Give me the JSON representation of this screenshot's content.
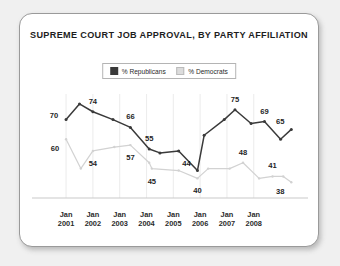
{
  "card": {
    "title": "SUPREME COURT JOB APPROVAL, BY PARTY AFFILIATION"
  },
  "legend": {
    "position": "top-center",
    "entries": [
      {
        "label": "% Republicans",
        "color": "#3a3a3a",
        "swatch": "republicans-swatch"
      },
      {
        "label": "% Democrats",
        "color": "#dcdcdc",
        "swatch": "democrats-swatch"
      }
    ]
  },
  "chart_data": {
    "type": "line",
    "title": "SUPREME COURT JOB APPROVAL, BY PARTY AFFILIATION",
    "xlabel": "",
    "ylabel": "",
    "ylim": [
      30,
      80
    ],
    "grid": "vertical-only",
    "legend_position": "top-center",
    "tick_labels": [
      {
        "line1": "Jan",
        "line2": "2001"
      },
      {
        "line1": "Jan",
        "line2": "2002"
      },
      {
        "line1": "Jan",
        "line2": "2003"
      },
      {
        "line1": "Jan",
        "line2": "2004"
      },
      {
        "line1": "Jan",
        "line2": "2005"
      },
      {
        "line1": "Jan",
        "line2": "2006"
      },
      {
        "line1": "Jan",
        "line2": "2007"
      },
      {
        "line1": "Jan",
        "line2": "2008"
      }
    ],
    "series": [
      {
        "name": "% Republicans",
        "color": "#3a3a3a",
        "points": [
          {
            "x": 0.0,
            "y": 70,
            "label": "70"
          },
          {
            "x": 0.5,
            "y": 78,
            "label": ""
          },
          {
            "x": 1.0,
            "y": 74,
            "label": "74"
          },
          {
            "x": 1.75,
            "y": 70,
            "label": ""
          },
          {
            "x": 2.4,
            "y": 66,
            "label": "66"
          },
          {
            "x": 3.1,
            "y": 55,
            "label": "55"
          },
          {
            "x": 3.5,
            "y": 53,
            "label": ""
          },
          {
            "x": 4.2,
            "y": 54,
            "label": ""
          },
          {
            "x": 4.9,
            "y": 44,
            "label": "44"
          },
          {
            "x": 5.15,
            "y": 62,
            "label": ""
          },
          {
            "x": 5.9,
            "y": 70,
            "label": ""
          },
          {
            "x": 6.3,
            "y": 75,
            "label": "75"
          },
          {
            "x": 6.9,
            "y": 68,
            "label": ""
          },
          {
            "x": 7.4,
            "y": 69,
            "label": "69"
          },
          {
            "x": 8.0,
            "y": 60,
            "label": ""
          },
          {
            "x": 8.4,
            "y": 65,
            "label": "65"
          }
        ]
      },
      {
        "name": "% Democrats",
        "color": "#d2d2d2",
        "points": [
          {
            "x": 0.0,
            "y": 60,
            "label": "60"
          },
          {
            "x": 0.55,
            "y": 45,
            "label": ""
          },
          {
            "x": 1.0,
            "y": 54,
            "label": "54"
          },
          {
            "x": 1.8,
            "y": 56,
            "label": ""
          },
          {
            "x": 2.4,
            "y": 57,
            "label": "57"
          },
          {
            "x": 3.1,
            "y": 48,
            "label": ""
          },
          {
            "x": 3.2,
            "y": 45,
            "label": "45"
          },
          {
            "x": 4.2,
            "y": 44,
            "label": ""
          },
          {
            "x": 4.9,
            "y": 40,
            "label": "40"
          },
          {
            "x": 5.3,
            "y": 45,
            "label": ""
          },
          {
            "x": 6.1,
            "y": 45,
            "label": ""
          },
          {
            "x": 6.6,
            "y": 48,
            "label": "48"
          },
          {
            "x": 7.2,
            "y": 40,
            "label": ""
          },
          {
            "x": 7.7,
            "y": 41,
            "label": "41"
          },
          {
            "x": 8.1,
            "y": 41,
            "label": ""
          },
          {
            "x": 8.4,
            "y": 38,
            "label": "38"
          }
        ]
      }
    ],
    "data_labels": [
      {
        "text": "70",
        "series": "% Republicans",
        "x": 0.0,
        "y": 70,
        "anchor": "left-above"
      },
      {
        "text": "74",
        "series": "% Republicans",
        "x": 1.0,
        "y": 74,
        "anchor": "above"
      },
      {
        "text": "66",
        "series": "% Republicans",
        "x": 2.4,
        "y": 66,
        "anchor": "above"
      },
      {
        "text": "55",
        "series": "% Republicans",
        "x": 3.1,
        "y": 55,
        "anchor": "above"
      },
      {
        "text": "44",
        "series": "% Republicans",
        "x": 4.9,
        "y": 44,
        "anchor": "above-left"
      },
      {
        "text": "75",
        "series": "% Republicans",
        "x": 6.3,
        "y": 75,
        "anchor": "above"
      },
      {
        "text": "69",
        "series": "% Republicans",
        "x": 7.4,
        "y": 69,
        "anchor": "above"
      },
      {
        "text": "65",
        "series": "% Republicans",
        "x": 8.4,
        "y": 65,
        "anchor": "above-left"
      },
      {
        "text": "60",
        "series": "% Democrats",
        "x": 0.0,
        "y": 60,
        "anchor": "below-left"
      },
      {
        "text": "54",
        "series": "% Democrats",
        "x": 1.0,
        "y": 54,
        "anchor": "below"
      },
      {
        "text": "57",
        "series": "% Democrats",
        "x": 2.4,
        "y": 57,
        "anchor": "below"
      },
      {
        "text": "45",
        "series": "% Democrats",
        "x": 3.2,
        "y": 45,
        "anchor": "below"
      },
      {
        "text": "40",
        "series": "% Democrats",
        "x": 4.9,
        "y": 40,
        "anchor": "below"
      },
      {
        "text": "48",
        "series": "% Democrats",
        "x": 6.6,
        "y": 48,
        "anchor": "above"
      },
      {
        "text": "41",
        "series": "% Democrats",
        "x": 7.7,
        "y": 41,
        "anchor": "above"
      },
      {
        "text": "38",
        "series": "% Democrats",
        "x": 8.4,
        "y": 38,
        "anchor": "below-left"
      }
    ]
  },
  "colors": {
    "republicans": "#3a3a3a",
    "democrats": "#d2d2d2",
    "axis": "#c9c9c9",
    "grid": "#ededed",
    "card_border": "#9a9a9a",
    "page_background": "#f0f0f0"
  }
}
